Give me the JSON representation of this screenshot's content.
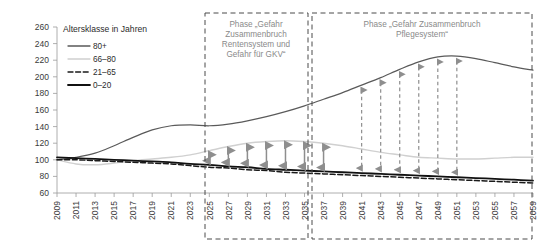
{
  "chart_data": {
    "type": "line",
    "title": "",
    "xlabel": "",
    "ylabel": "",
    "legend_title": "Altersklasse in Jahren",
    "legend_position": "top-left inside plot",
    "grid": false,
    "xlim": [
      2009,
      2059
    ],
    "ylim": [
      60,
      260
    ],
    "ytick_step": 20,
    "xtick_step": 2,
    "index_base_note": "Index, 2009 = 100",
    "yticks": [
      60,
      80,
      100,
      120,
      140,
      160,
      180,
      200,
      220,
      240,
      260
    ],
    "x": [
      2009,
      2011,
      2013,
      2015,
      2017,
      2019,
      2021,
      2023,
      2025,
      2027,
      2029,
      2031,
      2033,
      2035,
      2037,
      2039,
      2041,
      2043,
      2045,
      2047,
      2049,
      2051,
      2053,
      2055,
      2057,
      2059
    ],
    "xticklabels": [
      "2009",
      "2011",
      "2013",
      "2015",
      "2017",
      "2019",
      "2021",
      "2023",
      "2025",
      "2027",
      "2029",
      "2031",
      "2033",
      "2035",
      "2037",
      "2039",
      "2041",
      "2043",
      "2045",
      "2047",
      "2049",
      "2051",
      "2053",
      "2055",
      "2057",
      "2059"
    ],
    "series": [
      {
        "name": "80+",
        "color": "#5a5a5a",
        "style": "solid",
        "width": 1.2,
        "values": [
          100,
          103,
          108,
          117,
          127,
          136,
          141,
          142,
          141,
          143,
          147,
          152,
          158,
          165,
          173,
          181,
          190,
          199,
          209,
          218,
          224,
          225,
          222,
          217,
          212,
          208
        ]
      },
      {
        "name": "66-80",
        "color": "#d0d0d0",
        "style": "solid",
        "width": 1.4,
        "values": [
          100,
          95,
          94,
          96,
          99,
          101,
          103,
          106,
          111,
          116,
          120,
          122,
          123,
          122,
          120,
          117,
          113,
          109,
          106,
          103,
          102,
          101,
          101,
          102,
          103,
          103
        ]
      },
      {
        "name": "21-65",
        "color": "#1a1a1a",
        "style": "dashed",
        "width": 1.5,
        "values": [
          100,
          100,
          99,
          98,
          97,
          96,
          95,
          93,
          91,
          90,
          88,
          87,
          85,
          84,
          83,
          82,
          81,
          80,
          79,
          78,
          77,
          76,
          75,
          74,
          73,
          72
        ]
      },
      {
        "name": "0-20",
        "color": "#111111",
        "style": "solid",
        "width": 1.8,
        "values": [
          103,
          102,
          101,
          100,
          99,
          98,
          97,
          95,
          94,
          92,
          91,
          89,
          88,
          87,
          86,
          85,
          84,
          83,
          82,
          81,
          80,
          79,
          78,
          77,
          76,
          75
        ]
      }
    ],
    "annotations": [
      {
        "id": "phase-1",
        "label": "Phase „Gefahr Zusammenbruch Rentensystem und Gefahr für GKV“",
        "lines": [
          "Phase „Gefahr",
          "Zusammenbruch",
          "Rentensystem und",
          "Gefahr für GKV“"
        ],
        "x_start": 2024,
        "x_end": 2038,
        "style": "dashed-box",
        "arrows": "double-headed solid gray, between 0–20 line and 66–80 line"
      },
      {
        "id": "phase-2",
        "label": "Phase „Gefahr Zusammenbruch Pflegesystem“",
        "lines": [
          "Phase „Gefahr Zusammenbruch",
          "Pflegesystem“"
        ],
        "x_start": 2038,
        "x_end": 2059,
        "style": "dashed-box",
        "arrows": "double-headed dashed gray, between 0–20 line and 80+ line"
      }
    ]
  },
  "legend": {
    "title": "Altersklasse in Jahren",
    "items": [
      {
        "label": "80+",
        "color": "#5a5a5a",
        "style": "solid"
      },
      {
        "label": "66–80",
        "color": "#d0d0d0",
        "style": "solid"
      },
      {
        "label": "21–65",
        "color": "#1a1a1a",
        "style": "dashed"
      },
      {
        "label": "0–20",
        "color": "#111111",
        "style": "solid"
      }
    ]
  },
  "phase1": {
    "line1": "Phase „Gefahr",
    "line2": "Zusammenbruch",
    "line3": "Rentensystem und",
    "line4": "Gefahr für GKV“"
  },
  "phase2": {
    "line1": "Phase „Gefahr Zusammenbruch",
    "line2": "Pflegesystem“"
  }
}
